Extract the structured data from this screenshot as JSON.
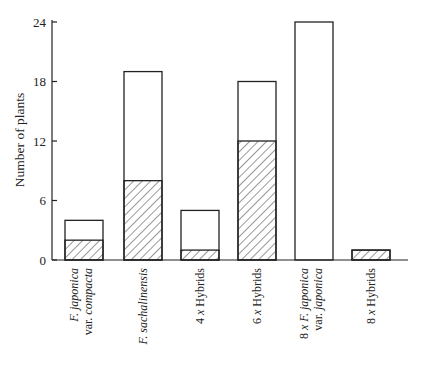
{
  "chart_data": {
    "type": "bar",
    "stacked": true,
    "title": "",
    "xlabel": "",
    "ylabel": "Number of plants",
    "ylim": [
      0,
      24
    ],
    "yticks": [
      0,
      6,
      12,
      18,
      24
    ],
    "grid": false,
    "legend": null,
    "categories": [
      {
        "line1": "F.  japonica",
        "line1_italic": true,
        "line2_prefix": "var. ",
        "line2_italic_part": "compacta"
      },
      {
        "line1": "F.  sachalinensis",
        "line1_italic": true
      },
      {
        "line1_prefix": "4 x ",
        "line1_rest": " Hybrids"
      },
      {
        "line1_prefix": "6 x ",
        "line1_rest": " Hybrids"
      },
      {
        "line1_prefix": "8 x ",
        "line1_italic_part": "F.  japonica",
        "line2_prefix": "var. ",
        "line2_italic_part": "japonica"
      },
      {
        "line1_prefix": "8 x ",
        "line1_rest": " Hybrids"
      }
    ],
    "category_names": [
      "F. japonica var. compacta",
      "F. sachalinensis",
      "4x Hybrids",
      "6x Hybrids",
      "8x F. japonica var. japonica",
      "8x Hybrids"
    ],
    "series": [
      {
        "name": "hatched (lower segment)",
        "pattern": "diagonal-hatch",
        "values": [
          2,
          8,
          1,
          12,
          0,
          1
        ]
      },
      {
        "name": "open (upper segment)",
        "pattern": "none",
        "values": [
          2,
          11,
          4,
          6,
          24,
          0
        ]
      }
    ],
    "totals": [
      4,
      19,
      5,
      18,
      24,
      1
    ]
  },
  "colors": {
    "stroke": "#222222",
    "fill": "#ffffff",
    "hatch": "#333333"
  }
}
